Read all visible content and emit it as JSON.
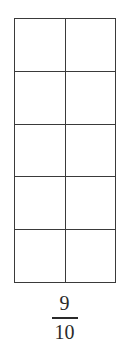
{
  "diagram": {
    "type": "fraction-grid",
    "rows": 5,
    "columns": 2,
    "total_cells": 10,
    "shaded_cells": 0,
    "line_color": "#3a3a3a",
    "fill_color": "#ffffff"
  },
  "fraction": {
    "numerator": "9",
    "denominator": "10"
  }
}
